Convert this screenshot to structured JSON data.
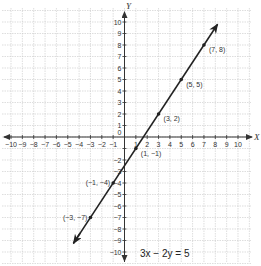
{
  "chart_data": {
    "type": "line",
    "title": "",
    "equation": "3x − 2y = 5",
    "xlabel": "X",
    "ylabel": "Y",
    "xlim": [
      -10,
      10
    ],
    "ylim": [
      -10,
      10
    ],
    "grid": true,
    "x_ticks": [
      "−10",
      "−9",
      "−8",
      "−7",
      "−6",
      "−5",
      "−4",
      "−3",
      "−2",
      "−1",
      "1",
      "2",
      "3",
      "4",
      "5",
      "6",
      "7",
      "8",
      "9",
      "10"
    ],
    "x_tick_values": [
      -10,
      -9,
      -8,
      -7,
      -6,
      -5,
      -4,
      -3,
      -2,
      -1,
      1,
      2,
      3,
      4,
      5,
      6,
      7,
      8,
      9,
      10
    ],
    "y_ticks": [
      "10",
      "9",
      "8",
      "7",
      "6",
      "5",
      "4",
      "3",
      "2",
      "1",
      "−2",
      "−3",
      "−4",
      "−5",
      "−6",
      "−7",
      "−8",
      "−9",
      "−10"
    ],
    "y_tick_values": [
      10,
      9,
      8,
      7,
      6,
      5,
      4,
      3,
      2,
      1,
      -2,
      -3,
      -4,
      -5,
      -6,
      -7,
      -8,
      -9,
      -10
    ],
    "origin_label": "0",
    "series": [
      {
        "name": "3x − 2y = 5",
        "slope": 1.5,
        "intercept": -2.5,
        "line_extent_x": [
          -4.5,
          8.2
        ],
        "points": [
          {
            "x": 7,
            "y": 8,
            "label": "(7, 8)"
          },
          {
            "x": 5,
            "y": 5,
            "label": "(5, 5)"
          },
          {
            "x": 3,
            "y": 2,
            "label": "(3, 2)"
          },
          {
            "x": 1,
            "y": -1,
            "label": "(1, −1)"
          },
          {
            "x": -1,
            "y": -4,
            "label": "(−1, −4)"
          },
          {
            "x": -3,
            "y": -7,
            "label": "(−3, −7)"
          }
        ]
      }
    ]
  }
}
